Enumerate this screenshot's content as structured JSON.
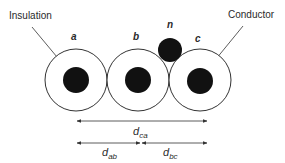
{
  "diagram": {
    "labels": {
      "insulation": "Insulation",
      "conductor": "Conductor"
    },
    "conductors": [
      {
        "id": "a",
        "label": "a"
      },
      {
        "id": "b",
        "label": "b"
      },
      {
        "id": "c",
        "label": "c"
      }
    ],
    "neutral": {
      "label": "n"
    },
    "dimensions": {
      "dca": {
        "base": "d",
        "sub": "ca"
      },
      "dab": {
        "base": "d",
        "sub": "ab"
      },
      "dbc": {
        "base": "d",
        "sub": "bc"
      }
    },
    "colors": {
      "line": "#333333",
      "fill": "#111111",
      "background": "#ffffff"
    }
  }
}
